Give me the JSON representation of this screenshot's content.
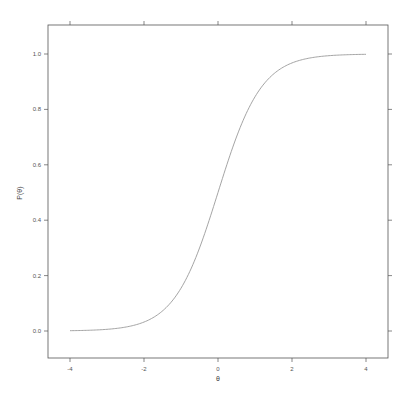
{
  "chart_data": {
    "type": "line",
    "title": "",
    "xlabel": "θ",
    "ylabel": "P(θ)",
    "xlim": [
      -4,
      4
    ],
    "ylim": [
      0.0,
      1.0
    ],
    "grid": false,
    "legend": null,
    "x_ticks": [
      -4,
      -2,
      0,
      2,
      4
    ],
    "x_tick_labels": [
      "-4",
      "-2",
      "0",
      "2",
      "4"
    ],
    "y_ticks": [
      0.0,
      0.2,
      0.4,
      0.6,
      0.8,
      1.0
    ],
    "y_tick_labels": [
      "0.0",
      "0.2",
      "0.4",
      "0.6",
      "0.8",
      "1.0"
    ],
    "series": [
      {
        "name": "P(θ)",
        "color": "#9a9a9a",
        "x": [
          -4,
          -3.5,
          -3,
          -2.5,
          -2,
          -1.5,
          -1,
          -0.5,
          0,
          0.5,
          1,
          1.5,
          2,
          2.5,
          3,
          3.5,
          4
        ],
        "y": [
          0.001,
          0.003,
          0.006,
          0.014,
          0.032,
          0.072,
          0.154,
          0.299,
          0.5,
          0.701,
          0.846,
          0.928,
          0.968,
          0.986,
          0.994,
          0.997,
          0.999
        ]
      }
    ]
  },
  "colors": {
    "frame": "#444444",
    "curve": "#9a9a9a",
    "text": "#555555"
  }
}
